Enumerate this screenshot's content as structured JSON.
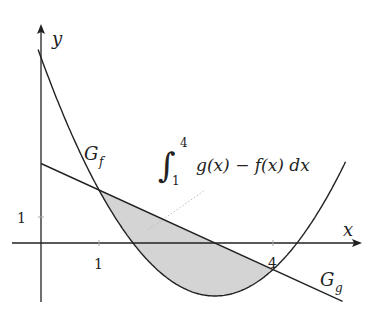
{
  "diagram": {
    "axes": {
      "x_label": "x",
      "y_label": "y",
      "x_tick_labels": [
        "1",
        "4"
      ],
      "y_tick_labels": [
        "1"
      ]
    },
    "curves": [
      {
        "name": "G_f",
        "label_main": "G",
        "label_sub": "f",
        "type": "parabola",
        "equation": "f(x) = x^2 - 6x + 7"
      },
      {
        "name": "G_g",
        "label_main": "G",
        "label_sub": "g",
        "type": "line",
        "equation": "g(x) = 3 - x"
      }
    ],
    "shaded_region": {
      "from": 1,
      "to": 4,
      "between": [
        "g",
        "f"
      ]
    },
    "integral": {
      "lower": "1",
      "upper": "4",
      "integrand": "g(x) − f(x) dx"
    },
    "colors": {
      "stroke": "#222222",
      "fill": "#d4d4d4"
    }
  }
}
